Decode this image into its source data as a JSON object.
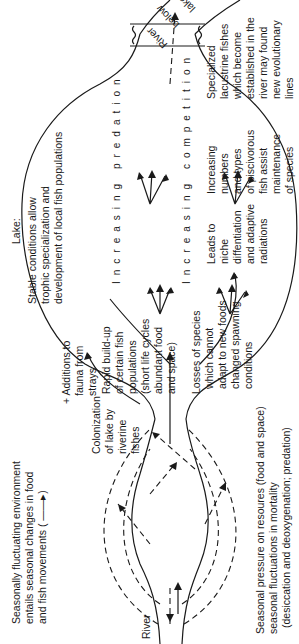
{
  "diagram": {
    "orientation": "rotated 90 degrees counter-clockwise (text reads bottom-to-top)",
    "labels": {
      "river_in": "River",
      "river_out": "River below lake",
      "river_out_1": "River",
      "river_out_2": "below",
      "river_out_3": "lake",
      "seasonal_env": [
        "Seasonally fluctuating environment",
        "entails seasonal changes in food",
        "and fish movements ( ——▸)"
      ],
      "seasonal_pressure": [
        "Seasonal pressure on resoures (food and space)",
        "seasonal fluctuations in mortality",
        "(desiccation and deoxygenation; predation)"
      ],
      "colonization": [
        "Colonization",
        "of lake by",
        "riverine",
        "fishes"
      ],
      "additions": [
        "+ Additions to",
        "fauna from",
        "strays"
      ],
      "rapid_buildup": [
        "Rapid build-up",
        "of certain fish",
        "populations",
        "(short life cycles",
        "abundant food",
        "and space)"
      ],
      "losses": [
        "Losses of species",
        "which cannot",
        "adapt to new foods",
        "changed spawning",
        "conditions"
      ],
      "lake": [
        "Lake:",
        "Stable conditions allow",
        "trophic specialization and",
        "development of local fish populations"
      ],
      "increasing_competition": "Increasing competition",
      "increasing_predation": "Increasing predation",
      "leads_to": [
        "Leads to",
        "niche",
        "diffentiation",
        "and adaptive",
        "radiations"
      ],
      "piscivorous": [
        "Increasing",
        "numbers",
        "and types",
        "of piscivorous",
        "fish assist",
        "maintenance",
        "of species",
        "diversity"
      ],
      "specialized": [
        "Specialized",
        "lacustrine fishes",
        "which become",
        "established in the",
        "river may found",
        "new evolutionary",
        "lines"
      ]
    }
  }
}
